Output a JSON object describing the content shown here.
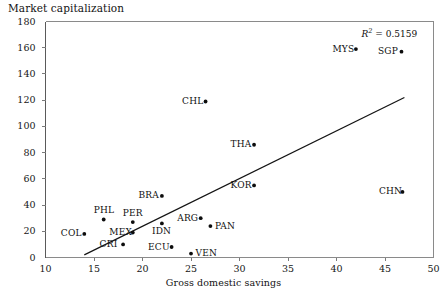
{
  "chart_data": {
    "type": "scatter",
    "title": "",
    "ylabel": "Market capitalization",
    "xlabel": "Gross domestic savings",
    "xlim": [
      10,
      50
    ],
    "ylim": [
      0,
      180
    ],
    "xticks": [
      10,
      15,
      20,
      25,
      30,
      35,
      40,
      45,
      50
    ],
    "yticks": [
      0,
      20,
      40,
      60,
      80,
      100,
      120,
      140,
      160,
      180
    ],
    "grid": false,
    "legend": null,
    "annotations": [
      {
        "name": "r2",
        "text_italic": "R",
        "text_sup": "2",
        "text_rest": " = 0.5159",
        "value": 0.5159,
        "x": 46.5,
        "y": 172
      }
    ],
    "trendline": {
      "type": "linear",
      "x0": 14.0,
      "y0": 2.0,
      "x1": 47.0,
      "y1": 122.0
    },
    "points": [
      {
        "label": "COL",
        "x": 14.0,
        "y": 18.0,
        "label_pos": "left"
      },
      {
        "label": "PHL",
        "x": 16.0,
        "y": 29.0,
        "label_pos": "above"
      },
      {
        "label": "MEX",
        "x": 19.0,
        "y": 19.0,
        "label_pos": "left"
      },
      {
        "label": "CRI",
        "x": 18.0,
        "y": 10.0,
        "label_pos": "left"
      },
      {
        "label": "PER",
        "x": 19.0,
        "y": 27.0,
        "label_pos": "above"
      },
      {
        "label": "BRA",
        "x": 22.0,
        "y": 47.0,
        "label_pos": "left"
      },
      {
        "label": "IDN",
        "x": 22.0,
        "y": 26.0,
        "label_pos": "below"
      },
      {
        "label": "ECU",
        "x": 23.0,
        "y": 8.0,
        "label_pos": "left"
      },
      {
        "label": "VEN",
        "x": 25.0,
        "y": 3.0,
        "label_pos": "right"
      },
      {
        "label": "ARG",
        "x": 26.0,
        "y": 30.0,
        "label_pos": "left"
      },
      {
        "label": "PAN",
        "x": 27.0,
        "y": 24.0,
        "label_pos": "right"
      },
      {
        "label": "CHL",
        "x": 26.5,
        "y": 119.0,
        "label_pos": "left"
      },
      {
        "label": "THA",
        "x": 31.5,
        "y": 86.0,
        "label_pos": "left"
      },
      {
        "label": "KOR",
        "x": 31.5,
        "y": 55.0,
        "label_pos": "left"
      },
      {
        "label": "MYS",
        "x": 42.0,
        "y": 159.0,
        "label_pos": "left"
      },
      {
        "label": "SGP",
        "x": 46.7,
        "y": 157.0,
        "label_pos": "left"
      },
      {
        "label": "CHN",
        "x": 46.8,
        "y": 50.0,
        "label_pos": "left"
      }
    ]
  },
  "axes": {
    "ylabel_text": "Market capitalization",
    "xlabel_text": "Gross domestic savings"
  }
}
